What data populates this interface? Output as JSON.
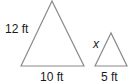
{
  "figure": {
    "large_triangle": {
      "side_label": "12 ft",
      "base_label": "10 ft",
      "points": "21,66 52,1 84,66"
    },
    "small_triangle": {
      "side_label": "x",
      "base_label": "5 ft",
      "points": "95,66 111,33 127,66"
    },
    "stroke_color": "#8a8a8a",
    "text_color": "#1a1a1a"
  }
}
